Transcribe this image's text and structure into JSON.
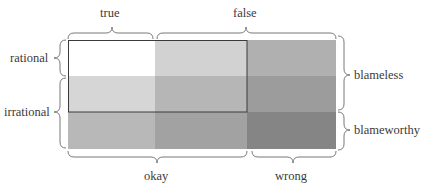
{
  "diagram": {
    "columns_top": [
      {
        "label": "true"
      },
      {
        "label": "false"
      }
    ],
    "columns_bottom": [
      {
        "label": "okay"
      },
      {
        "label": "wrong"
      }
    ],
    "rows_left": [
      {
        "label": "rational"
      },
      {
        "label": "irrational"
      }
    ],
    "rows_right": [
      {
        "label": "blameless"
      },
      {
        "label": "blameworthy"
      }
    ],
    "grid": {
      "rows": 3,
      "cols": 3,
      "cell_colors": [
        [
          "#ffffff",
          "#d2d2d2",
          "#b0b0b0"
        ],
        [
          "#d6d6d6",
          "#b6b6b6",
          "#9c9c9c"
        ],
        [
          "#b8b8b8",
          "#a2a2a2",
          "#858585"
        ]
      ],
      "highlight_outline_color": "#3a3a3a"
    }
  }
}
